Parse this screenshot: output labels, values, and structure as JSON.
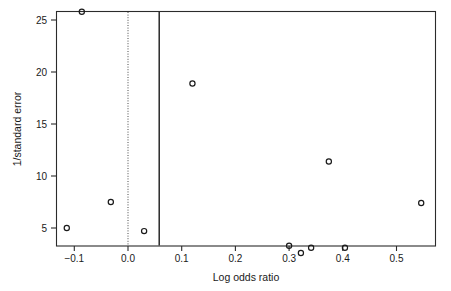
{
  "chart_data": {
    "type": "scatter",
    "title": "",
    "subtitle": "",
    "xlabel": "Log odds ratio",
    "ylabel": "1/standard error",
    "xlim": [
      -0.135,
      0.575
    ],
    "ylim": [
      1.9,
      26.6
    ],
    "grid": false,
    "legend": null,
    "xticks": [
      -0.1,
      0.0,
      0.1,
      0.2,
      0.3,
      0.4,
      0.5
    ],
    "xticklabels": [
      "−0.1",
      "0.0",
      "0.1",
      "0.2",
      "0.3",
      "0.4",
      "0.5"
    ],
    "yticks": [
      5,
      10,
      15,
      20,
      25
    ],
    "yticklabels": [
      "5",
      "10",
      "15",
      "20",
      "25"
    ],
    "series": [
      {
        "name": "studies",
        "marker": "open-circle",
        "points": [
          {
            "x": -0.114,
            "y": 5.0
          },
          {
            "x": -0.086,
            "y": 25.8
          },
          {
            "x": -0.032,
            "y": 7.5
          },
          {
            "x": 0.03,
            "y": 4.7
          },
          {
            "x": 0.12,
            "y": 18.9
          },
          {
            "x": 0.3,
            "y": 3.3
          },
          {
            "x": 0.322,
            "y": 2.6
          },
          {
            "x": 0.341,
            "y": 3.1
          },
          {
            "x": 0.374,
            "y": 11.4
          },
          {
            "x": 0.404,
            "y": 3.1
          },
          {
            "x": 0.546,
            "y": 7.4
          }
        ]
      }
    ],
    "annotations": [
      {
        "name": "null-effect-line",
        "type": "vline",
        "x": 0.0,
        "style": "dotted"
      },
      {
        "name": "pooled-effect-line",
        "type": "vline",
        "x": 0.058,
        "style": "solid"
      }
    ],
    "colors": {
      "marker": "#1a1a1a",
      "axis": "#2b2b2b",
      "background": "#ffffff"
    }
  }
}
